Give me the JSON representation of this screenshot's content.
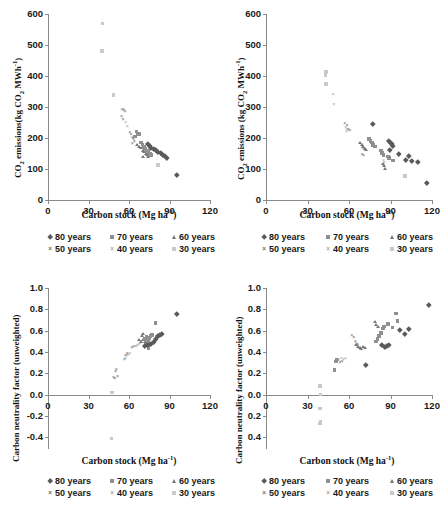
{
  "figure": {
    "layout": "2x2 grid of scatter plots",
    "panels": [
      "top-left",
      "top-right",
      "bottom-left",
      "bottom-right"
    ]
  },
  "series_style": {
    "80 years": {
      "marker": "diamond",
      "color": "#5a5a5a"
    },
    "70 years": {
      "marker": "square",
      "color": "#909090"
    },
    "60 years": {
      "marker": "triangle",
      "color": "#777777"
    },
    "50 years": {
      "marker": "cross",
      "color": "#6e6e6e"
    },
    "40 years": {
      "marker": "cross-light",
      "color": "#a8a8a8"
    },
    "30 years": {
      "marker": "square-light",
      "color": "#c9c9c9"
    }
  },
  "legend": {
    "entries": [
      "80 years",
      "70 years",
      "60 years",
      "50 years",
      "40 years",
      "30 years"
    ],
    "row1": [
      "80 years",
      "70 years",
      "60 years"
    ],
    "row2": [
      "50 years",
      "40 years",
      "30 years"
    ]
  },
  "labels": {
    "xlabel_main": "Carbon stock (Mg ha",
    "xlabel_sup": "-1",
    "xlabel_close": ")",
    "ylabel_co2_left": "CO2 emissions(kg CO2 MWh-1)",
    "ylabel_co2_right": "CO2 emissions (kg CO2 MWh-1)",
    "ylabel_cnf": "Carbon neutrality factor (unweighted)"
  },
  "chart_data": [
    {
      "id": "top-left",
      "type": "scatter",
      "title": "",
      "xlabel": "Carbon stock (Mg ha-1)",
      "ylabel": "CO2 emissions (kg CO2 MWh-1)",
      "xlim": [
        0,
        120
      ],
      "ylim": [
        0,
        600
      ],
      "xticks": [
        0,
        30,
        60,
        90,
        120
      ],
      "yticks": [
        0,
        100,
        200,
        300,
        400,
        500,
        600
      ],
      "grid": false,
      "legend_position": "below",
      "series": [
        {
          "name": "30 years",
          "points": [
            [
              40.5,
              570
            ],
            [
              40.0,
              480
            ],
            [
              48.5,
              338
            ],
            [
              81.5,
              113
            ]
          ]
        },
        {
          "name": "40 years",
          "points": [
            [
              54.5,
              292
            ],
            [
              55.5,
              288
            ],
            [
              57.5,
              249
            ],
            [
              58.8,
              237
            ],
            [
              62.0,
              200
            ],
            [
              63.5,
              193
            ],
            [
              70.5,
              163
            ],
            [
              71.5,
              157
            ],
            [
              72.5,
              152
            ],
            [
              73.0,
              148
            ],
            [
              73.5,
              144
            ]
          ]
        },
        {
          "name": "50 years",
          "points": [
            [
              56.0,
              290
            ],
            [
              57.0,
              285
            ],
            [
              54.5,
              268
            ],
            [
              55.5,
              260
            ],
            [
              60.5,
              217
            ],
            [
              61.5,
              210
            ],
            [
              63.0,
              196
            ],
            [
              64.0,
              188
            ],
            [
              62.5,
              182
            ]
          ]
        },
        {
          "name": "70 years",
          "points": [
            [
              65.5,
              221
            ],
            [
              66.5,
              215
            ],
            [
              67.5,
              212
            ],
            [
              64.5,
              205
            ],
            [
              69.0,
              186
            ],
            [
              70.0,
              179
            ],
            [
              71.0,
              172
            ],
            [
              72.0,
              166
            ],
            [
              73.5,
              160
            ],
            [
              74.5,
              154
            ],
            [
              75.5,
              150
            ],
            [
              76.5,
              146
            ]
          ]
        },
        {
          "name": "60 years",
          "points": [
            [
              66.0,
              178
            ],
            [
              67.0,
              172
            ],
            [
              68.5,
              168
            ],
            [
              70.0,
              160
            ],
            [
              71.0,
              155
            ],
            [
              72.0,
              150
            ],
            [
              73.0,
              145
            ],
            [
              70.5,
              141
            ],
            [
              74.0,
              139
            ]
          ]
        },
        {
          "name": "80 years",
          "points": [
            [
              74.0,
              182
            ],
            [
              75.5,
              175
            ],
            [
              76.5,
              170
            ],
            [
              78.0,
              166
            ],
            [
              79.5,
              161
            ],
            [
              81.0,
              157
            ],
            [
              83.5,
              152
            ],
            [
              85.0,
              146
            ],
            [
              86.5,
              141
            ],
            [
              88.0,
              137
            ],
            [
              95.5,
              80
            ]
          ]
        }
      ]
    },
    {
      "id": "top-right",
      "type": "scatter",
      "xlabel": "Carbon stock (Mg ha-1)",
      "ylabel": "CO2 emissions (kg CO2 MWh-1)",
      "xlim": [
        0,
        120
      ],
      "ylim": [
        0,
        600
      ],
      "xticks": [
        0,
        30,
        60,
        90,
        120
      ],
      "yticks": [
        0,
        100,
        200,
        300,
        400,
        500,
        600
      ],
      "grid": false,
      "legend_position": "below",
      "series": [
        {
          "name": "30 years",
          "points": [
            [
              43.5,
              413
            ],
            [
              43.0,
              402
            ],
            [
              43.5,
              375
            ],
            [
              100.5,
              78
            ]
          ]
        },
        {
          "name": "40 years",
          "points": [
            [
              48.5,
              340
            ],
            [
              49.0,
              308
            ],
            [
              57.5,
              232
            ],
            [
              58.5,
              226
            ],
            [
              58.0,
              221
            ],
            [
              85.0,
              128
            ],
            [
              85.5,
              120
            ],
            [
              84.5,
              113
            ]
          ]
        },
        {
          "name": "50 years",
          "points": [
            [
              57.0,
              245
            ],
            [
              58.5,
              238
            ],
            [
              59.5,
              228
            ],
            [
              60.5,
              222
            ],
            [
              70.0,
              170
            ],
            [
              70.5,
              165
            ],
            [
              69.5,
              146
            ],
            [
              70.5,
              141
            ]
          ]
        },
        {
          "name": "60 years",
          "points": [
            [
              68.0,
              185
            ],
            [
              69.0,
              178
            ],
            [
              70.0,
              172
            ],
            [
              71.0,
              167
            ],
            [
              72.0,
              162
            ],
            [
              84.5,
              118
            ],
            [
              85.0,
              110
            ],
            [
              85.5,
              100
            ]
          ]
        },
        {
          "name": "70 years",
          "points": [
            [
              74.5,
              196
            ],
            [
              75.5,
              190
            ],
            [
              76.5,
              185
            ],
            [
              77.5,
              178
            ],
            [
              79.0,
              172
            ],
            [
              83.0,
              160
            ],
            [
              84.0,
              152
            ],
            [
              85.0,
              146
            ],
            [
              88.0,
              140
            ],
            [
              89.0,
              135
            ],
            [
              92.0,
              128
            ]
          ]
        },
        {
          "name": "80 years",
          "points": [
            [
              77.0,
              246
            ],
            [
              88.5,
              190
            ],
            [
              90.0,
              186
            ],
            [
              91.0,
              181
            ],
            [
              92.0,
              176
            ],
            [
              89.5,
              162
            ],
            [
              96.0,
              148
            ],
            [
              103.0,
              144
            ],
            [
              101.0,
              130
            ],
            [
              105.5,
              127
            ],
            [
              109.5,
              124
            ],
            [
              116.5,
              55
            ]
          ]
        }
      ]
    },
    {
      "id": "bottom-left",
      "type": "scatter",
      "xlabel": "Carbon stock (Mg ha-1)",
      "ylabel": "Carbon neutrality factor (unweighted)",
      "xlim": [
        0,
        120
      ],
      "ylim": [
        -0.5,
        1.0
      ],
      "xticks": [
        0,
        30,
        60,
        90,
        120
      ],
      "yticks": [
        -0.4,
        -0.2,
        0.0,
        0.2,
        0.4,
        0.6,
        0.8,
        1.0
      ],
      "grid": false,
      "legend_position": "below",
      "series": [
        {
          "name": "30 years",
          "points": [
            [
              47.5,
              0.02
            ],
            [
              47.0,
              -0.41
            ]
          ]
        },
        {
          "name": "50 years",
          "points": [
            [
              50.5,
              0.23
            ],
            [
              50.0,
              0.21
            ],
            [
              48.5,
              0.16
            ],
            [
              49.5,
              0.15
            ],
            [
              51.5,
              0.17
            ],
            [
              56.5,
              0.33
            ],
            [
              57.5,
              0.36
            ],
            [
              58.5,
              0.38
            ],
            [
              62.0,
              0.44
            ],
            [
              63.5,
              0.45
            ]
          ]
        },
        {
          "name": "40 years",
          "points": [
            [
              57.5,
              0.34
            ],
            [
              58.5,
              0.36
            ],
            [
              59.5,
              0.37
            ],
            [
              60.5,
              0.38
            ],
            [
              65.0,
              0.45
            ],
            [
              66.0,
              0.46
            ],
            [
              67.0,
              0.47
            ],
            [
              68.0,
              0.48
            ]
          ]
        },
        {
          "name": "60 years",
          "points": [
            [
              67.5,
              0.52
            ],
            [
              68.5,
              0.5
            ],
            [
              69.5,
              0.55
            ],
            [
              70.5,
              0.52
            ],
            [
              71.5,
              0.5
            ],
            [
              72.5,
              0.49
            ],
            [
              73.5,
              0.48
            ],
            [
              70.0,
              0.57
            ]
          ]
        },
        {
          "name": "70 years",
          "points": [
            [
              71.5,
              0.52
            ],
            [
              72.5,
              0.51
            ],
            [
              73.0,
              0.54
            ],
            [
              74.0,
              0.5
            ],
            [
              75.0,
              0.53
            ],
            [
              76.0,
              0.55
            ],
            [
              77.0,
              0.56
            ],
            [
              79.5,
              0.67
            ],
            [
              73.5,
              0.46
            ],
            [
              74.5,
              0.44
            ]
          ]
        },
        {
          "name": "80 years",
          "points": [
            [
              72.0,
              0.46
            ],
            [
              74.0,
              0.47
            ],
            [
              76.0,
              0.48
            ],
            [
              78.5,
              0.5
            ],
            [
              80.0,
              0.52
            ],
            [
              81.5,
              0.55
            ],
            [
              83.0,
              0.56
            ],
            [
              84.5,
              0.57
            ],
            [
              95.5,
              0.76
            ]
          ]
        }
      ]
    },
    {
      "id": "bottom-right",
      "type": "scatter",
      "xlabel": "Carbon stock (Mg ha-1)",
      "ylabel": "Carbon neutrality factor (unweighted)",
      "xlim": [
        0,
        120
      ],
      "ylim": [
        -0.5,
        1.0
      ],
      "xticks": [
        0,
        30,
        60,
        90,
        120
      ],
      "yticks": [
        -0.4,
        -0.2,
        0.0,
        0.2,
        0.4,
        0.6,
        0.8,
        1.0
      ],
      "grid": false,
      "legend_position": "below",
      "series": [
        {
          "name": "30 years",
          "points": [
            [
              39.0,
              0.08
            ],
            [
              39.5,
              0.0
            ],
            [
              39.0,
              -0.13
            ],
            [
              39.5,
              -0.25
            ],
            [
              39.0,
              -0.27
            ]
          ]
        },
        {
          "name": "70 years",
          "points": [
            [
              49.5,
              0.23
            ],
            [
              50.5,
              0.31
            ],
            [
              51.5,
              0.33
            ],
            [
              79.5,
              0.5
            ],
            [
              80.5,
              0.52
            ],
            [
              81.5,
              0.55
            ],
            [
              83.0,
              0.58
            ],
            [
              84.5,
              0.62
            ],
            [
              85.5,
              0.64
            ],
            [
              88.0,
              0.66
            ],
            [
              94.0,
              0.76
            ],
            [
              95.0,
              0.69
            ],
            [
              91.5,
              0.63
            ]
          ]
        },
        {
          "name": "40 years",
          "points": [
            [
              52.5,
              0.32
            ],
            [
              54.5,
              0.34
            ],
            [
              56.0,
              0.33
            ],
            [
              57.5,
              0.34
            ],
            [
              65.5,
              0.48
            ],
            [
              66.5,
              0.46
            ]
          ]
        },
        {
          "name": "50 years",
          "points": [
            [
              53.5,
              0.3
            ],
            [
              55.0,
              0.31
            ],
            [
              62.0,
              0.55
            ],
            [
              63.5,
              0.53
            ],
            [
              64.5,
              0.5
            ],
            [
              66.0,
              0.47
            ]
          ]
        },
        {
          "name": "60 years",
          "points": [
            [
              64.5,
              0.47
            ],
            [
              66.0,
              0.45
            ],
            [
              67.5,
              0.44
            ],
            [
              68.5,
              0.43
            ],
            [
              70.0,
              0.45
            ],
            [
              71.5,
              0.44
            ],
            [
              78.5,
              0.68
            ],
            [
              79.5,
              0.66
            ],
            [
              80.5,
              0.64
            ]
          ]
        },
        {
          "name": "80 years",
          "points": [
            [
              72.5,
              0.28
            ],
            [
              84.0,
              0.47
            ],
            [
              86.0,
              0.45
            ],
            [
              87.5,
              0.46
            ],
            [
              88.5,
              0.47
            ],
            [
              96.5,
              0.61
            ],
            [
              100.5,
              0.57
            ],
            [
              103.5,
              0.62
            ],
            [
              117.5,
              0.84
            ]
          ]
        }
      ]
    }
  ]
}
